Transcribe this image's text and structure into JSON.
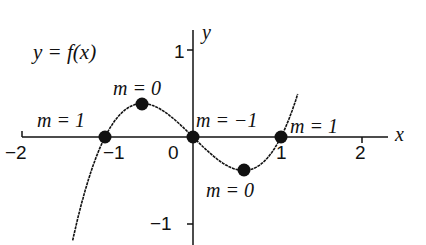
{
  "title": "y = f(x)",
  "axes": {
    "x_label": "x",
    "y_label": "y",
    "x_ticks": [
      "−2",
      "−1",
      "0",
      "1",
      "2"
    ],
    "y_ticks": [
      "1",
      "−1"
    ]
  },
  "annotations": {
    "left_zero": "m = 1",
    "local_max": "m = 0",
    "origin": "m = −1",
    "right_zero": "m = 1",
    "local_min": "m = 0"
  },
  "chart_data": {
    "type": "line",
    "title": "y = f(x)",
    "function": "f(x) = x^3 - x",
    "xlabel": "x",
    "ylabel": "y",
    "xlim": [
      -2,
      2.2
    ],
    "ylim": [
      -1.3,
      1.5
    ],
    "grid": false,
    "points": [
      {
        "x": -1,
        "y": 0,
        "label": "m = 1"
      },
      {
        "x": -0.577,
        "y": 0.385,
        "label": "m = 0"
      },
      {
        "x": 0,
        "y": 0,
        "label": "m = −1"
      },
      {
        "x": 0.577,
        "y": -0.385,
        "label": "m = 0"
      },
      {
        "x": 1,
        "y": 0,
        "label": "m = 1"
      }
    ]
  },
  "colors": {
    "ink": "#111111",
    "background": "#ffffff"
  }
}
